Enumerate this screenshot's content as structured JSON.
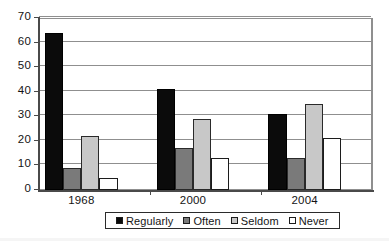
{
  "chart_data": {
    "type": "bar",
    "title": "",
    "subtitle": "",
    "xlabel": "",
    "ylabel": "",
    "categories": [
      "1968",
      "2000",
      "2004"
    ],
    "series": [
      {
        "name": "Regularly",
        "color": "#0b0b0b",
        "values": [
          64,
          41,
          31
        ]
      },
      {
        "name": "Often",
        "color": "#7a7a7a",
        "values": [
          9,
          17,
          13
        ]
      },
      {
        "name": "Seldom",
        "color": "#c8c8c8",
        "values": [
          22,
          29,
          35
        ]
      },
      {
        "name": "Never",
        "color": "#ffffff",
        "values": [
          5,
          13,
          21
        ]
      }
    ],
    "ylim": [
      0,
      70
    ],
    "ytick_step": 10,
    "yticks": [
      0,
      10,
      20,
      30,
      40,
      50,
      60,
      70
    ],
    "ytick_labels": [
      "0",
      "10",
      "20",
      "30",
      "40",
      "50",
      "60",
      "70"
    ],
    "grid": true,
    "grid_axis": "y",
    "legend": true,
    "legend_position": "bottom-center",
    "legend_entries": [
      "Regularly",
      "Often",
      "Seldom",
      "Never"
    ],
    "bar_group_gap_ratio": 0.35,
    "plot_background": "#ffffff",
    "axis_color": "#4a4a4a",
    "gridline_color": "#8f8f8f"
  }
}
